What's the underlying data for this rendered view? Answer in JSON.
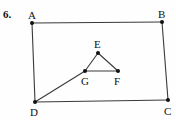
{
  "figure": {
    "problem_number": "6.",
    "width": 176,
    "height": 120,
    "background_color": "#fefefe",
    "stroke_color": "#3a3a3a",
    "vertex_color": "#111111",
    "label_color": "#111111",
    "vertices": [
      {
        "id": "A",
        "label": "A",
        "x": 32,
        "y": 23,
        "label_x": 28,
        "label_y": 10
      },
      {
        "id": "B",
        "label": "B",
        "x": 162,
        "y": 22,
        "label_x": 158,
        "label_y": 9
      },
      {
        "id": "C",
        "label": "C",
        "x": 168,
        "y": 100,
        "label_x": 164,
        "label_y": 106
      },
      {
        "id": "D",
        "label": "D",
        "x": 35,
        "y": 102,
        "label_x": 30,
        "label_y": 107
      },
      {
        "id": "E",
        "label": "E",
        "x": 98,
        "y": 53,
        "label_x": 94,
        "label_y": 39
      },
      {
        "id": "F",
        "label": "F",
        "x": 118,
        "y": 71,
        "label_x": 114,
        "label_y": 76
      },
      {
        "id": "G",
        "label": "G",
        "x": 85,
        "y": 71,
        "label_x": 81,
        "label_y": 76
      }
    ],
    "segments": [
      {
        "name": "AB",
        "from": "A",
        "to": "B"
      },
      {
        "name": "BC",
        "from": "B",
        "to": "C"
      },
      {
        "name": "CD",
        "from": "C",
        "to": "D"
      },
      {
        "name": "DA",
        "from": "D",
        "to": "A"
      },
      {
        "name": "EF",
        "from": "E",
        "to": "F"
      },
      {
        "name": "FG",
        "from": "F",
        "to": "G"
      },
      {
        "name": "GE",
        "from": "G",
        "to": "E"
      },
      {
        "name": "DG",
        "from": "D",
        "to": "G"
      }
    ]
  }
}
